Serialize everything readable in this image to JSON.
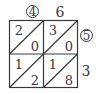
{
  "diagram": {
    "type": "lattice-multiplication",
    "top_labels": [
      {
        "text": "4",
        "circled": true
      },
      {
        "text": "6",
        "circled": false
      }
    ],
    "right_labels": [
      {
        "text": "5",
        "circled": true
      },
      {
        "text": "3",
        "circled": false
      }
    ],
    "cells": [
      [
        {
          "tens": "2",
          "ones": "0"
        },
        {
          "tens": "3",
          "ones": "0"
        }
      ],
      [
        {
          "tens": "1",
          "ones": "2"
        },
        {
          "tens": "1",
          "ones": "8"
        }
      ]
    ],
    "line_color": "#3a3a3a"
  }
}
